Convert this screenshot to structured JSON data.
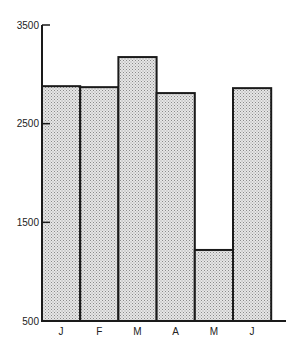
{
  "chart_data": {
    "type": "bar",
    "title": "",
    "xlabel": "",
    "ylabel": "",
    "categories": [
      "J",
      "F",
      "M",
      "A",
      "M",
      "J"
    ],
    "values": [
      2880,
      2870,
      3175,
      2810,
      1220,
      2860
    ],
    "yticks": [
      500,
      1500,
      2500,
      3500
    ],
    "ytick_labels": [
      "500",
      "1500",
      "2500",
      "3500"
    ],
    "ylim": [
      500,
      3500
    ],
    "grid": false,
    "legend": null,
    "bar_fill": "dotted-gray",
    "bar_edge_color": "#1a1a1a"
  }
}
